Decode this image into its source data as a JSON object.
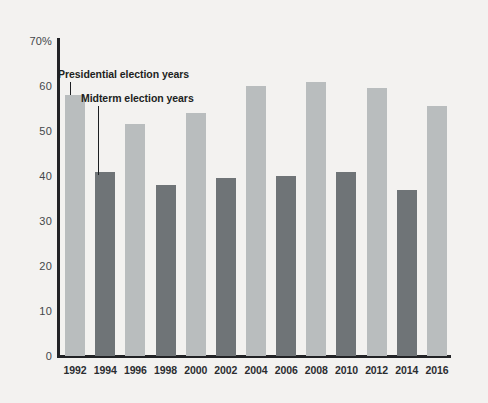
{
  "chart_data": {
    "type": "bar",
    "title": "",
    "subtitle": "",
    "xlabel": "",
    "ylabel": "",
    "categories": [
      "1992",
      "1994",
      "1996",
      "1998",
      "2000",
      "2002",
      "2004",
      "2006",
      "2008",
      "2010",
      "2012",
      "2014",
      "2016"
    ],
    "values": [
      58,
      41,
      51.5,
      38,
      54,
      39.5,
      60,
      40,
      61,
      41,
      59.5,
      37,
      55.5
    ],
    "series": [
      {
        "name": "Presidential election years",
        "color": "#b9bdbe",
        "points": [
          {
            "x": "1992",
            "y": 58
          },
          {
            "x": "1996",
            "y": 51.5
          },
          {
            "x": "2000",
            "y": 54
          },
          {
            "x": "2004",
            "y": 60
          },
          {
            "x": "2008",
            "y": 61
          },
          {
            "x": "2012",
            "y": 59.5
          },
          {
            "x": "2016",
            "y": 55.5
          }
        ]
      },
      {
        "name": "Midterm election years",
        "color": "#6f7477",
        "points": [
          {
            "x": "1994",
            "y": 41
          },
          {
            "x": "1998",
            "y": 38
          },
          {
            "x": "2002",
            "y": 39.5
          },
          {
            "x": "2006",
            "y": 40
          },
          {
            "x": "2010",
            "y": 41
          },
          {
            "x": "2014",
            "y": 37
          }
        ]
      }
    ],
    "bar_types": [
      "presidential",
      "midterm",
      "presidential",
      "midterm",
      "presidential",
      "midterm",
      "presidential",
      "midterm",
      "presidential",
      "midterm",
      "presidential",
      "midterm",
      "presidential"
    ],
    "ylim": [
      0,
      70
    ],
    "yticks": [
      0,
      10,
      20,
      30,
      40,
      50,
      60,
      70
    ],
    "ytick_labels": [
      "0",
      "10",
      "20",
      "30",
      "40",
      "50",
      "60",
      "70%"
    ],
    "grid": false,
    "legend_position": "inline-annotations"
  },
  "annotations": {
    "presidential": "Presidential election years",
    "midterm": "Midterm election years"
  },
  "colors": {
    "background": "#f3f2f0",
    "axis": "#222326",
    "presidential_bar": "#b9bdbe",
    "midterm_bar": "#6f7477",
    "tick_text": "#44474a",
    "label_text": "#2b2d30"
  }
}
